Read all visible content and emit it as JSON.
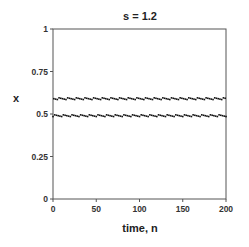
{
  "chart_data": {
    "type": "scatter",
    "title": "s = 1.2",
    "xlabel": "time,  n",
    "ylabel": "x",
    "xlim": [
      0,
      200
    ],
    "ylim": [
      0,
      1
    ],
    "xticks": [
      0,
      50,
      100,
      150,
      200
    ],
    "xtick_labels": [
      "0",
      "50",
      "100",
      "150",
      "200"
    ],
    "yticks": [
      0,
      0.25,
      0.5,
      0.75,
      1
    ],
    "ytick_labels": [
      "0",
      "0.25",
      "0.5",
      "0.75",
      "1"
    ],
    "grid": false,
    "legend": null,
    "series": [
      {
        "name": "x_n",
        "description": "period-2 oscillation alternating between two levels for n = 0..200",
        "upper_level": 0.59,
        "lower_level": 0.49,
        "n_start": 0,
        "n_end": 200
      }
    ]
  }
}
